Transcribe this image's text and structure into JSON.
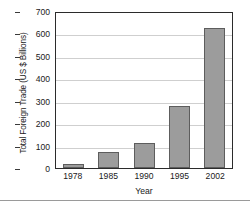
{
  "chart_data": {
    "type": "bar",
    "title": "",
    "xlabel": "Year",
    "ylabel": "Total Foreign Trade (US $ Billions)",
    "categories": [
      "1978",
      "1985",
      "1990",
      "1995",
      "2002"
    ],
    "values": [
      20,
      73,
      113,
      278,
      625
    ],
    "ylim": [
      0,
      700
    ],
    "yticks": [
      0,
      100,
      200,
      300,
      400,
      500,
      600,
      700
    ],
    "ytick_labels": [
      "0",
      "100",
      "200",
      "300",
      "400",
      "500",
      "600",
      "700"
    ],
    "grid": true,
    "grid_axis": "y",
    "legend": false,
    "series": [
      {
        "name": "Total Foreign Trade",
        "values": [
          20,
          73,
          113,
          278,
          625
        ]
      }
    ],
    "colors": {
      "bar_fill": "#9c9c9c",
      "bar_border": "#5d5d5d",
      "gridline": "#cfcfcf",
      "frame": "#2b2b2b",
      "text": "#1a1a1a",
      "background": "#ffffff"
    }
  }
}
